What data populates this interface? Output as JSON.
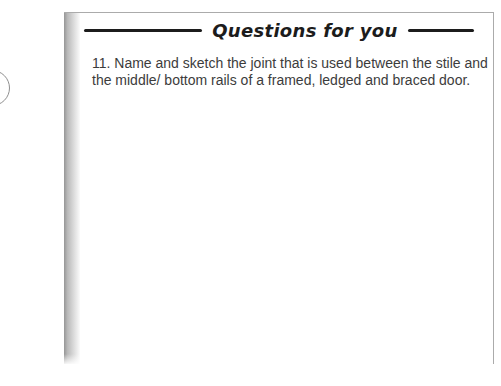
{
  "colors": {
    "page_background": "#ffffff",
    "box_border": "#ababab",
    "header_rule": "#1c1c1c",
    "title_text": "#1c1c1c",
    "question_text": "#3c3c3c",
    "page_edge_dark": "#969696",
    "page_edge_light": "#fbfbfb",
    "circle_stroke": "#8f8f8f"
  },
  "questions_box": {
    "title": "Questions for you",
    "question": {
      "number": "11",
      "text": "11. Name and sketch the joint that is used between the stile and the middle/ bottom rails of a framed, ledged and braced door.",
      "lines": [
        "11. Name and sketch the joint that is used between the stile and",
        "the middle/ bottom rails of a framed, ledged and braced door."
      ]
    }
  }
}
